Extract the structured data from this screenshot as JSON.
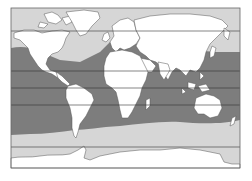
{
  "map": {
    "type": "world-map",
    "projection": "equirectangular",
    "frame": {
      "x": 11,
      "y": 8,
      "width": 229,
      "height": 160
    },
    "colors": {
      "background": "#ffffff",
      "land": "#ffffff",
      "coastline": "#555555",
      "warm_ocean": "#7d7d7d",
      "cold_ocean": "#d6d6d6",
      "antarctica": "#ffffff",
      "latitude_lines": "#333333",
      "frame": "#666666"
    },
    "zones": [
      {
        "name": "northern-cold-ocean",
        "shade": "light"
      },
      {
        "name": "warm-ocean-band",
        "shade": "dark"
      },
      {
        "name": "southern-cold-ocean",
        "shade": "light"
      },
      {
        "name": "antarctica",
        "shade": "white"
      }
    ],
    "latitude_lines_y": [
      31,
      71,
      88,
      105,
      147
    ]
  }
}
